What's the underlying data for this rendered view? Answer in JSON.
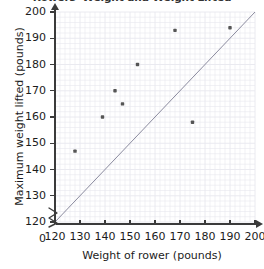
{
  "chart_data": {
    "type": "scatter",
    "title": "Rowers' Weight and Weight Lifted",
    "xlabel": "Weight of rower (pounds)",
    "ylabel": "Maximum weight lifted (pounds)",
    "xlim": [
      120,
      200
    ],
    "ylim": [
      120,
      200
    ],
    "xticks": [
      120,
      130,
      140,
      150,
      160,
      170,
      180,
      190,
      200
    ],
    "yticks": [
      120,
      130,
      140,
      150,
      160,
      170,
      180,
      190,
      200
    ],
    "y_origin_label": "0",
    "grid": true,
    "minor_grid_step": 2,
    "legend": null,
    "axis_break": true,
    "point_color": "#555555",
    "line_color": "#8a8a9e",
    "grid_color": "#e8e8ee",
    "points": [
      {
        "x": 128,
        "y": 147
      },
      {
        "x": 139,
        "y": 160
      },
      {
        "x": 144,
        "y": 170
      },
      {
        "x": 147,
        "y": 165
      },
      {
        "x": 153,
        "y": 180
      },
      {
        "x": 168,
        "y": 193
      },
      {
        "x": 175,
        "y": 158
      },
      {
        "x": 190,
        "y": 194
      }
    ],
    "trend_line": {
      "x1": 120,
      "y1": 120,
      "x2": 200,
      "y2": 200
    }
  }
}
